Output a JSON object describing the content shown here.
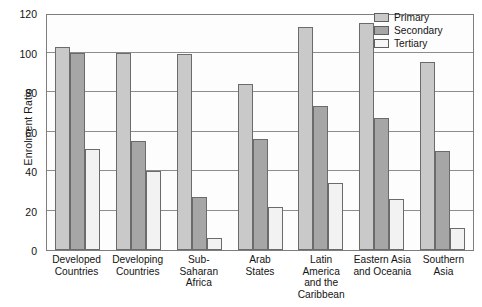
{
  "chart_data": {
    "type": "bar",
    "title": "",
    "xlabel": "",
    "ylabel": "Enrolment Ratio",
    "ylim": [
      0,
      120
    ],
    "yticks": [
      0,
      20,
      40,
      60,
      80,
      100,
      120
    ],
    "grid": true,
    "legend_position": "top-right",
    "categories": [
      "Developed Countries",
      "Developing Countries",
      "Sub-Saharan Africa",
      "Arab States",
      "Latin America and the Caribbean",
      "Eastern Asia and Oceania",
      "Southern Asia"
    ],
    "category_lines": [
      [
        "Developed",
        "Countries"
      ],
      [
        "Developing",
        "Countries"
      ],
      [
        "Sub-Saharan",
        "Africa"
      ],
      [
        "Arab",
        "States"
      ],
      [
        "Latin",
        "America",
        "and the",
        "Caribbean"
      ],
      [
        "Eastern Asia",
        "and Oceania"
      ],
      [
        "Southern",
        "Asia"
      ]
    ],
    "series": [
      {
        "name": "Primary",
        "color": "#c9c9c9",
        "values": [
          103,
          100,
          99,
          84,
          113,
          115,
          95
        ]
      },
      {
        "name": "Secondary",
        "color": "#a6a6a6",
        "values": [
          100,
          55,
          27,
          56,
          73,
          67,
          50
        ]
      },
      {
        "name": "Tertiary",
        "color": "#f2f2f2",
        "values": [
          51,
          40,
          6,
          22,
          34,
          26,
          11
        ]
      }
    ]
  },
  "legend": {
    "items": [
      {
        "label": "Primary",
        "swatch": "primary-swatch"
      },
      {
        "label": "Secondary",
        "swatch": "secondary-swatch"
      },
      {
        "label": "Tertiary",
        "swatch": "tertiary-swatch"
      }
    ]
  },
  "axes": {
    "y_title": "Enrolment Ratio"
  }
}
